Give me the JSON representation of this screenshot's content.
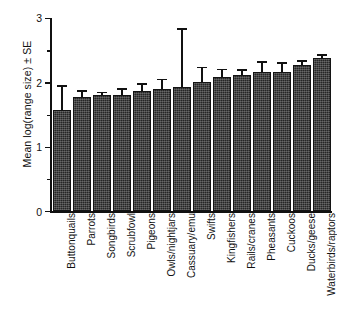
{
  "chart_data": {
    "type": "bar",
    "title": "",
    "xlabel": "",
    "ylabel": "Mean log(range size) ± SE",
    "ylim": [
      0,
      3
    ],
    "yticks": [
      "0",
      "1",
      "2",
      "3"
    ],
    "ytick_values": [
      0,
      1,
      2,
      3
    ],
    "yminor_ticks": [
      0.5,
      1.5,
      2.5
    ],
    "grid": false,
    "legend": "none",
    "error_bars": "upper only (standard error)",
    "categories": [
      "Buttonquails",
      "Parrots",
      "Songbirds",
      "Scrubfowl",
      "Pigeons",
      "Owls/nightjars",
      "Cassuary/emu",
      "Swifts",
      "Kingfishers",
      "Rails/cranes",
      "Pheasants",
      "Cuckoos",
      "Ducks/geese",
      "Waterbirds/raptors"
    ],
    "values": [
      1.57,
      1.78,
      1.8,
      1.8,
      1.86,
      1.89,
      1.92,
      2.01,
      2.08,
      2.12,
      2.16,
      2.16,
      2.27,
      2.38
    ],
    "error_upper": [
      1.93,
      1.85,
      1.83,
      1.88,
      1.96,
      2.03,
      2.82,
      2.22,
      2.19,
      2.18,
      2.3,
      2.29,
      2.32,
      2.41
    ],
    "bar_color": "#262626",
    "axis_color": "#111111",
    "background_color": "#ffffff"
  },
  "axis": {
    "y_title": "Mean log(range size) ± SE",
    "tick_0": "0",
    "tick_1": "1",
    "tick_2": "2",
    "tick_3": "3"
  }
}
